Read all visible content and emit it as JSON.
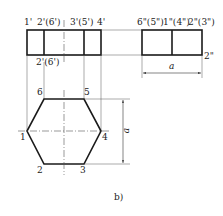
{
  "figure": {
    "caption": "b)",
    "front_view": {
      "labels_top": [
        "1'",
        "2'(6')",
        "3'(5')",
        "4'"
      ],
      "label_bottom": "2'(6')"
    },
    "side_view": {
      "labels_top": [
        "6\"(5\")",
        "1\"(4\")",
        "2\"(3\")"
      ],
      "label_right": "2\"",
      "dimension": "a"
    },
    "top_view": {
      "vertices": [
        "1",
        "2",
        "3",
        "4",
        "5",
        "6"
      ],
      "dimension": "a"
    },
    "colors": {
      "line": "#1a1a1a",
      "thin_line": "#555555",
      "background": "#ffffff"
    }
  }
}
